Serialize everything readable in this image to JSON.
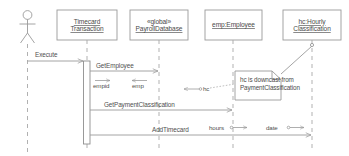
{
  "diagram": {
    "type": "uml-sequence-diagram",
    "colors": {
      "background": "#ffffff",
      "line": "#9a9a9a",
      "box_border": "#9a9a9a",
      "text": "#4f4f4f",
      "activation_fill": "#ffffff"
    }
  },
  "actor": {
    "name": "actor-stick-figure",
    "label": ""
  },
  "lifelines": [
    {
      "id": "timecard-transaction",
      "line1": "Timecard",
      "line2": "Transaction",
      "stereotype": ""
    },
    {
      "id": "payroll-database",
      "line1": "PayrollDatabase",
      "line2": "",
      "stereotype": "«global»"
    },
    {
      "id": "emp-employee",
      "line1": "emp:Employee",
      "line2": "",
      "stereotype": ""
    },
    {
      "id": "hc-hourly-classification",
      "line1": "hc:Hourly",
      "line2": "Classification",
      "stereotype": ""
    }
  ],
  "messages": [
    {
      "id": "execute",
      "label": "Execute"
    },
    {
      "id": "get-employee",
      "label": "GetEmployee"
    },
    {
      "id": "get-payment-classification",
      "label": "GetPaymentClassification"
    },
    {
      "id": "add-timecard",
      "label": "AddTimecard"
    }
  ],
  "parameters": [
    {
      "id": "empid",
      "label": "empid",
      "direction": "out"
    },
    {
      "id": "emp",
      "label": "emp",
      "direction": "in"
    },
    {
      "id": "hc",
      "label": "hc",
      "direction": "in"
    },
    {
      "id": "hours",
      "label": "hours",
      "direction": "out"
    },
    {
      "id": "date",
      "label": "date",
      "direction": "out"
    }
  ],
  "note": {
    "id": "downcast-note",
    "line1": "hc is downcast from",
    "line2": "PaymentClassification"
  }
}
